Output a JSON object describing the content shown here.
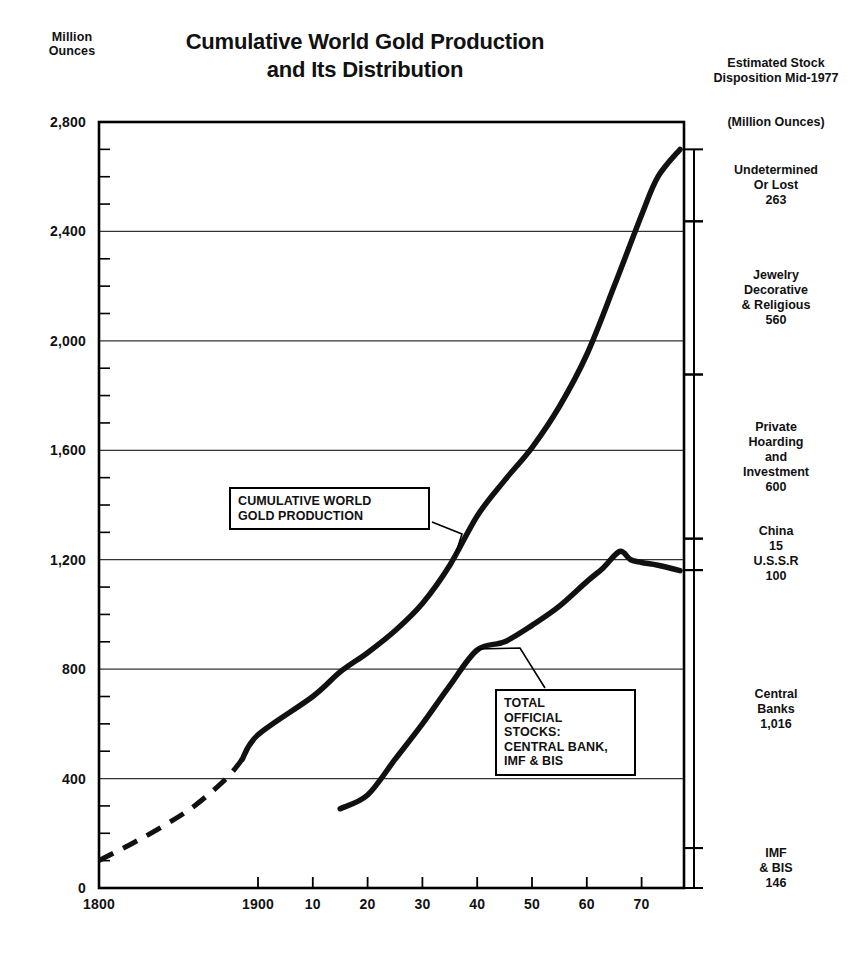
{
  "axis_unit_label": "Million\nOunces",
  "title": "Cumulative World Gold Production\nand Its Distribution",
  "title_line1": "Cumulative World Gold Production",
  "title_line2": "and Its Distribution",
  "right_panel": {
    "heading": "Estimated\nStock Disposition\nMid-1977",
    "subheading": "(Million Ounces)",
    "segments": [
      {
        "label": "Undetermined\nOr Lost\n263",
        "name": "Undetermined Or Lost",
        "value": 263,
        "from": 2437,
        "to": 2700
      },
      {
        "label": "Jewelry\nDecorative\n& Religious\n560",
        "name": "Jewelry Decorative & Religious",
        "value": 560,
        "from": 1877,
        "to": 2437
      },
      {
        "label": "Private\nHoarding\nand\nInvestment\n600",
        "name": "Private Hoarding and Investment",
        "value": 600,
        "from": 1277,
        "to": 1877
      },
      {
        "label": "China\n15\nU.S.S.R\n100",
        "name": "China / U.S.S.R",
        "value": 115,
        "from": 1162,
        "to": 1277
      },
      {
        "label": "Central\nBanks\n1,016",
        "name": "Central Banks",
        "value": 1016,
        "from": 146,
        "to": 1162
      },
      {
        "label": "IMF\n& BIS\n146",
        "name": "IMF & BIS",
        "value": 146,
        "from": 0,
        "to": 146
      }
    ]
  },
  "callouts": {
    "production": "CUMULATIVE WORLD\nGOLD PRODUCTION",
    "stocks": "TOTAL\nOFFICIAL\nSTOCKS:\nCENTRAL BANK,\nIMF & BIS"
  },
  "chart_data": {
    "type": "line",
    "title": "Cumulative World Gold Production and Its Distribution",
    "xlabel": "",
    "ylabel": "Million Ounces",
    "xlim": [
      1800,
      1977
    ],
    "ylim": [
      0,
      2800
    ],
    "grid": true,
    "legend": "inline-callouts",
    "y_ticks_major": [
      0,
      400,
      800,
      1200,
      1600,
      2000,
      2400,
      2800
    ],
    "y_tick_labels": [
      "0",
      "400",
      "800",
      "1,200",
      "1,600",
      "2,000",
      "2,400",
      "2,800"
    ],
    "y_tick_minor_step": 100,
    "x_ticks": [
      1800,
      1900,
      1910,
      1920,
      1930,
      1940,
      1950,
      1960,
      1970
    ],
    "x_tick_labels": [
      "1800",
      "1900",
      "10",
      "20",
      "30",
      "40",
      "50",
      "60",
      "70"
    ],
    "series": [
      {
        "name": "CUMULATIVE WORLD GOLD PRODUCTION",
        "style": "solid-thick-with-dashed-early-segment",
        "dashed_until_year": 1890,
        "x": [
          1800,
          1820,
          1840,
          1860,
          1880,
          1890,
          1900,
          1910,
          1915,
          1920,
          1925,
          1930,
          1935,
          1940,
          1945,
          1950,
          1955,
          1960,
          1965,
          1970,
          1973,
          1977
        ],
        "values": [
          100,
          160,
          225,
          300,
          400,
          470,
          560,
          700,
          790,
          860,
          940,
          1040,
          1180,
          1360,
          1490,
          1610,
          1760,
          1950,
          2200,
          2460,
          2600,
          2700
        ]
      },
      {
        "name": "TOTAL OFFICIAL STOCKS: CENTRAL BANK, IMF & BIS",
        "style": "solid-thick",
        "x": [
          1915,
          1920,
          1925,
          1930,
          1935,
          1940,
          1945,
          1950,
          1955,
          1960,
          1963,
          1966,
          1968,
          1970,
          1973,
          1977
        ],
        "values": [
          290,
          340,
          470,
          600,
          740,
          870,
          900,
          960,
          1030,
          1120,
          1170,
          1230,
          1200,
          1190,
          1180,
          1160
        ]
      }
    ],
    "annotations": [
      {
        "text": "CUMULATIVE WORLD GOLD PRODUCTION",
        "points_to_year": 1936,
        "points_to_value": 1215
      },
      {
        "text": "TOTAL OFFICIAL STOCKS: CENTRAL BANK, IMF & BIS",
        "points_to_year": 1940,
        "points_to_value": 873
      }
    ]
  },
  "colors": {
    "line": "#111111",
    "grid": "#333333",
    "frame": "#000000",
    "background": "#ffffff"
  }
}
